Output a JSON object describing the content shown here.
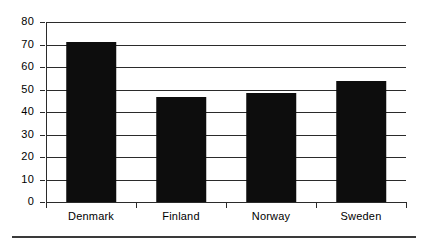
{
  "chart_data": {
    "type": "bar",
    "title": "",
    "xlabel": "",
    "ylabel": "",
    "categories": [
      "Denmark",
      "Finland",
      "Norway",
      "Sweden"
    ],
    "values": [
      71,
      46.5,
      48.5,
      54
    ],
    "ylim": [
      0,
      80
    ],
    "ytick_step": 10,
    "yticks": [
      80,
      70,
      60,
      50,
      40,
      30,
      20,
      10,
      0
    ],
    "ytick_labels": [
      "80",
      "70",
      "60",
      "50",
      "40",
      "30",
      "20",
      "10",
      "0"
    ],
    "grid": true,
    "grid_axis": "y",
    "legend": false,
    "bar_color": "#0d0d0d",
    "axis_color": "#2b2b2b",
    "background": "#ffffff"
  },
  "figure": {
    "bottom_rule_color": "#3a3a3a"
  }
}
